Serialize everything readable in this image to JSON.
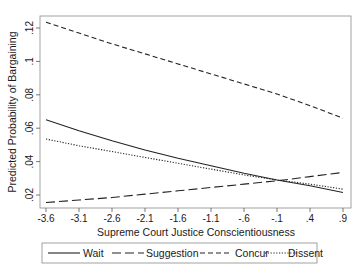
{
  "chart_data": {
    "type": "line",
    "title": "",
    "xlabel": "Supreme Court Justice Conscientiousness",
    "ylabel": "Predicted Probability of Bargaining",
    "xlim": [
      -3.6,
      0.9
    ],
    "ylim": [
      0.013,
      0.128
    ],
    "x_ticks": [
      "-3.6",
      "-3.1",
      "-2.6",
      "-2.1",
      "-1.6",
      "-1.1",
      "-.6",
      "-.1",
      ".4",
      ".9"
    ],
    "y_ticks": [
      ".02",
      ".04",
      ".06",
      ".08",
      ".1",
      ".12"
    ],
    "grid": false,
    "legend_position": "bottom",
    "x": [
      -3.6,
      -3.1,
      -2.6,
      -2.1,
      -1.6,
      -1.1,
      -0.6,
      -0.1,
      0.4,
      0.9
    ],
    "series": [
      {
        "name": "Wait",
        "style": "solid",
        "values": [
          0.065,
          0.0585,
          0.0525,
          0.047,
          0.042,
          0.0375,
          0.033,
          0.029,
          0.0255,
          0.0215
        ]
      },
      {
        "name": "Suggestion",
        "style": "longdash",
        "values": [
          0.0155,
          0.017,
          0.0185,
          0.0205,
          0.0225,
          0.0245,
          0.0265,
          0.0285,
          0.031,
          0.0335
        ]
      },
      {
        "name": "Concur",
        "style": "dash",
        "values": [
          0.1235,
          0.117,
          0.1105,
          0.1045,
          0.0985,
          0.0925,
          0.0865,
          0.0805,
          0.0735,
          0.066
        ]
      },
      {
        "name": "Dissent",
        "style": "dot",
        "values": [
          0.0535,
          0.0495,
          0.046,
          0.0425,
          0.039,
          0.0355,
          0.032,
          0.029,
          0.0265,
          0.0235
        ]
      }
    ]
  },
  "legend": {
    "items": [
      {
        "label": "Wait"
      },
      {
        "label": "Suggestion"
      },
      {
        "label": "Concur"
      },
      {
        "label": "Dissent"
      }
    ]
  }
}
